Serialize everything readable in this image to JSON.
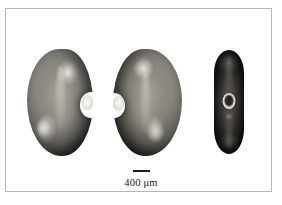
{
  "figure": {
    "kind": "micrograph-plate",
    "background_color": "#ffffff",
    "frame_color": "#b6b6b6",
    "caption_text": ""
  },
  "specimens": [
    {
      "id": "specimen-1",
      "label": "",
      "view": "ventral-face-view",
      "orientation": "hilum-right",
      "feature_label": "hilum",
      "tone": "#86847d"
    },
    {
      "id": "specimen-2",
      "label": "",
      "view": "dorsal-face-view",
      "orientation": "hilum-left",
      "feature_label": "hilum",
      "tone": "#858379"
    },
    {
      "id": "specimen-3",
      "label": "",
      "view": "lateral-edge-view",
      "orientation": "hilum-center",
      "feature_label": "hilum",
      "tone": "#3b3935"
    }
  ],
  "scale_bar": {
    "label": "400 μm",
    "value": 400,
    "unit": "μm",
    "bar_color": "#1c1c1c",
    "text_color": "#1a1a1a"
  }
}
